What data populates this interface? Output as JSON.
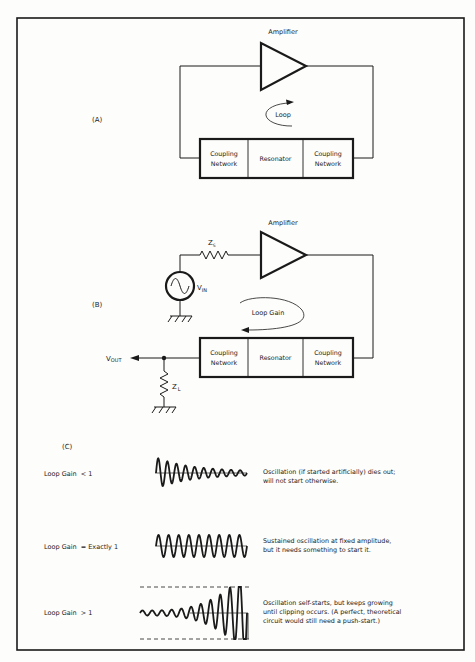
{
  "part_a": {
    "label": "(A)",
    "amplifier_label": "Amplifier",
    "loop_label": "Loop",
    "blocks": [
      {
        "line1": "Coupling",
        "line2": "Network"
      },
      {
        "line1": "Resonator",
        "line2": ""
      },
      {
        "line1": "Coupling",
        "line2": "Network"
      }
    ]
  },
  "part_b": {
    "label": "(B)",
    "amplifier_label": "Amplifier",
    "zs_label": "Z",
    "zs_sub": "S",
    "vin_label": "V",
    "vin_sub": "IN",
    "loop_label": "Loop Gain",
    "vout_label": "V",
    "vout_sub": "OUT",
    "zl_label": "Z",
    "zl_sub": "L",
    "blocks": [
      {
        "line1": "Coupling",
        "line2": "Network"
      },
      {
        "line1": "Resonator",
        "line2": ""
      },
      {
        "line1": "Coupling",
        "line2": "Network"
      }
    ]
  },
  "part_c": {
    "label": "(C)",
    "rows": [
      {
        "condition": "Loop Gain  < 1",
        "waveform": "decaying",
        "desc1": "Oscillation (if started artificially) dies out;",
        "desc2": "will not start otherwise.",
        "desc3": ""
      },
      {
        "condition": "Loop Gain  = Exactly 1",
        "waveform": "sustained",
        "desc1": "Sustained oscillation at fixed amplitude,",
        "desc2": "but it needs something to start it.",
        "desc3": ""
      },
      {
        "condition": "Loop Gain  > 1",
        "waveform": "growing-clipped",
        "desc1": "Oscillation self-starts, but keeps growing",
        "desc2": "until clipping occurs. (A perfect, theoretical",
        "desc3": "circuit would still need a push-start.)"
      }
    ]
  },
  "colors": {
    "ink": "#1a1a1a",
    "paper": "#fdfdfb"
  }
}
